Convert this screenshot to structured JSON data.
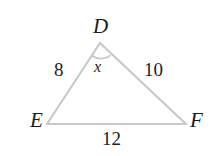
{
  "figure": {
    "type": "triangle-diagram",
    "shape_name": "triangle DEF",
    "stroke_color": "#c9c9c9",
    "text_color": "#1d1d1d",
    "background_color": "#ffffff",
    "vertices": [
      {
        "name": "D",
        "label": "D",
        "x": 100,
        "y": 43
      },
      {
        "name": "E",
        "label": "E",
        "x": 47,
        "y": 124
      },
      {
        "name": "F",
        "label": "F",
        "x": 186,
        "y": 124
      }
    ],
    "sides": [
      {
        "name": "DE",
        "label": "8",
        "from": "D",
        "to": "E"
      },
      {
        "name": "DF",
        "label": "10",
        "from": "D",
        "to": "F"
      },
      {
        "name": "EF",
        "label": "12",
        "from": "E",
        "to": "F"
      }
    ],
    "angles": [
      {
        "name": "D",
        "label": "x",
        "at_vertex": "D",
        "marked": true
      }
    ]
  }
}
